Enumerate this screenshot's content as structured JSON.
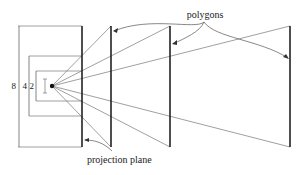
{
  "diagram": {
    "labels": {
      "polygons": "polygons",
      "projection_plane": "projection plane"
    },
    "dimensions": [
      {
        "value": "8",
        "label": "8"
      },
      {
        "value": "4",
        "label": "4"
      },
      {
        "value": "2",
        "label": "2"
      }
    ],
    "colors": {
      "line": "#555555",
      "thick": "#222222",
      "text": "#222222"
    }
  }
}
